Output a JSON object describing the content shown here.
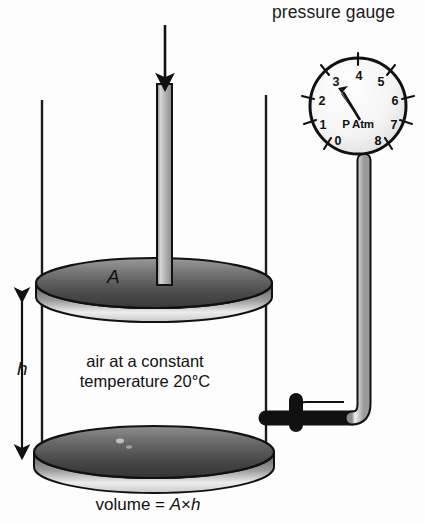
{
  "figure": {
    "title_label": "pressure gauge",
    "volume_caption_prefix": "volume = ",
    "volume_caption_A": "A",
    "volume_caption_times": "×",
    "volume_caption_h": "h",
    "area_label": "A",
    "height_label": "h",
    "gas_text_line1": "air at a constant",
    "gas_text_line2": "temperature 20°C"
  },
  "gauge": {
    "center_label": "P Atm",
    "needle_value": 3,
    "numbers": [
      {
        "value": "0",
        "angle_deg": 240
      },
      {
        "value": "1",
        "angle_deg": 210
      },
      {
        "value": "2",
        "angle_deg": 180
      },
      {
        "value": "3",
        "angle_deg": 145
      },
      {
        "value": "4",
        "angle_deg": 110
      },
      {
        "value": "5",
        "angle_deg": 72
      },
      {
        "value": "6",
        "angle_deg": 35
      },
      {
        "value": "7",
        "angle_deg": 5
      },
      {
        "value": "8",
        "angle_deg": 310
      }
    ]
  },
  "colors": {
    "background": "#fdfdfd",
    "outline": "#111111",
    "metal_light": "#f2f2f2",
    "metal_mid": "#b9b9b9",
    "metal_dark": "#4a4a4a",
    "disk_dark": "#3d3d3d",
    "disk_light": "#d8d8d8",
    "text": "#111111"
  },
  "annotations": {
    "force_arrow": "downward-force-arrow",
    "height_arrow": "height-double-arrow"
  }
}
